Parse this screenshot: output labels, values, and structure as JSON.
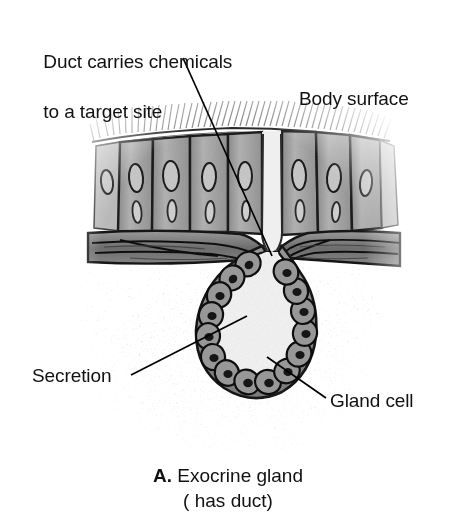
{
  "figure": {
    "type": "anatomical-illustration",
    "style": "grayscale halftone textbook drawing",
    "colors": {
      "background": "#ffffff",
      "text": "#111111",
      "leader_line": "#000000",
      "epithelial_cell_fill": "#a8a8a8",
      "cell_outline": "#1a1a1a",
      "connective_tissue": "#8f8f8f",
      "lumen": "#f2f2f2",
      "stroma_stipple": "#b5b5b5"
    }
  },
  "labels": {
    "duct": {
      "text": "Duct carries chemicals\nto a target site",
      "line1": "Duct carries chemicals",
      "line2": "to a target site",
      "leader": {
        "x1": 183,
        "y1": 58,
        "x2": 272,
        "y2": 256
      }
    },
    "body_surface": {
      "text": "Body surface",
      "leader": null
    },
    "secretion": {
      "text": "Secretion",
      "leader": {
        "x1": 131,
        "y1": 375,
        "x2": 247,
        "y2": 316
      }
    },
    "gland_cell": {
      "text": "Gland cell",
      "leader": {
        "x1": 267,
        "y1": 357,
        "x2": 326,
        "y2": 398
      }
    }
  },
  "caption": {
    "letter": "A.",
    "title": " Exocrine gland",
    "subtitle": "( has duct)"
  },
  "anatomy": {
    "parts": [
      "body surface with microvilli",
      "columnar epithelium",
      "basement membrane / connective tissue band",
      "duct",
      "secretory sac lumen",
      "gland cells with nuclei",
      "surrounding stroma"
    ],
    "epithelial_cell_count": 7,
    "gland_cell_count": 15
  }
}
